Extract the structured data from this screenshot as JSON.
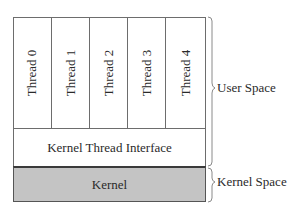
{
  "diagram": {
    "threads": [
      {
        "label": "Thread 0"
      },
      {
        "label": "Thread 1"
      },
      {
        "label": "Thread 2"
      },
      {
        "label": "Thread 3"
      },
      {
        "label": "Thread 4"
      }
    ],
    "kernel_thread_interface": "Kernel Thread Interface",
    "kernel": "Kernel",
    "brace_labels": {
      "user_space": "User Space",
      "kernel_space": "Kernel Space"
    },
    "colors": {
      "kernel_fill": "#c4c4c4",
      "border": "#6d6d6d"
    }
  }
}
